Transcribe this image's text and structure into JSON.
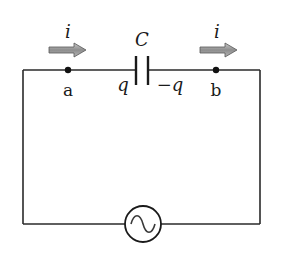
{
  "diagram": {
    "type": "circuit",
    "labels": {
      "current_left": "i",
      "current_right": "i",
      "capacitor": "C",
      "charge_positive": "q",
      "charge_negative": "−q",
      "node_a": "a",
      "node_b": "b"
    },
    "components": [
      {
        "kind": "capacitor",
        "label": "C"
      },
      {
        "kind": "ac-source",
        "symbol": "~"
      }
    ],
    "nodes": [
      "a",
      "b"
    ],
    "colors": {
      "wire": "#2a2a2a",
      "arrow_fill": "#9a9a9a",
      "arrow_stroke": "#555555",
      "text": "#1a1a1a"
    }
  }
}
